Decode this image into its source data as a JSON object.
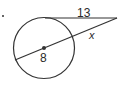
{
  "diagram": {
    "type": "circle-tangent-secant",
    "labels": {
      "tangent": "13",
      "secant_external": "x",
      "diameter": "8"
    },
    "colors": {
      "stroke": "#333333",
      "background": "#ffffff"
    }
  }
}
